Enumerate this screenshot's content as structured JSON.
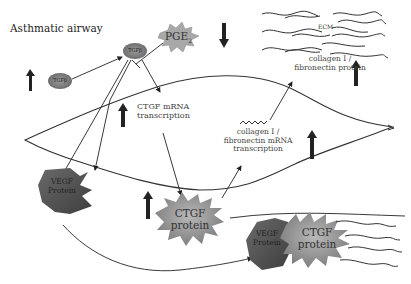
{
  "title": "Asthmatic airway",
  "nodes": {
    "tgfb_small": "TGFβ",
    "tgfb_main": "TGFβ",
    "pge2": "PGE",
    "pge2_sub": "2",
    "ecm": "ECM",
    "collagen_protein": [
      "collagen I /",
      "fibronectin protein"
    ],
    "ctgf_mrna": [
      "CTGF mRNA",
      "transcription"
    ],
    "collagen_mrna": [
      "collagen I /",
      "fibronectin mRNA",
      "transcription"
    ],
    "vegf_protein": [
      "VEGF",
      "Protein"
    ],
    "ctgf_protein": [
      "CTGF",
      "protein"
    ],
    "complex_vegf": [
      "VEGF",
      "Protein"
    ],
    "complex_ctgf": [
      "CTGF",
      "protein"
    ]
  },
  "indicators": {
    "tgfb_small": "up",
    "pge2": "down",
    "collagen_protein": "up",
    "ctgf_mrna": "up",
    "collagen_mrna": "up",
    "ctgf_protein": "up"
  },
  "colors": {
    "arrow": "#222222",
    "tgfb_fill": "#8a8a8a",
    "pge2_fill": "#a8a8a8",
    "vegf_fill": "#555555",
    "ctgf_fill": "#8f8f8f",
    "line": "#333333"
  }
}
